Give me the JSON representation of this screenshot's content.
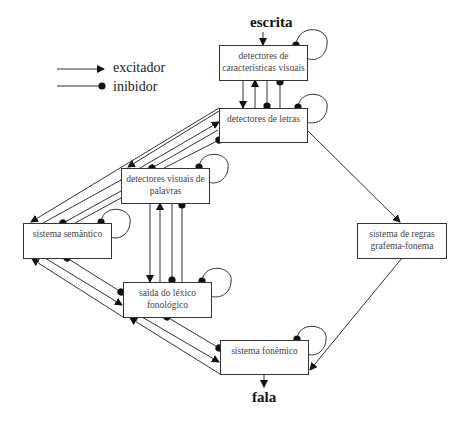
{
  "legend": {
    "excitatory": "excitador",
    "inhibitory": "inibidor"
  },
  "io": {
    "input": "escrita",
    "output": "fala"
  },
  "nodes": [
    {
      "id": "visual-features",
      "label": "detectores de características visuais",
      "line1": "detectores de",
      "line2": "características visuais"
    },
    {
      "id": "letter-detectors",
      "label": "detectores de letras",
      "line1": "detectores de letras",
      "line2": ""
    },
    {
      "id": "visual-word-detectors",
      "label": "detectores visuais de palavras",
      "line1": "detectores visuais de",
      "line2": "palavras"
    },
    {
      "id": "semantic-system",
      "label": "sistema semântico",
      "line1": "sistema semântico",
      "line2": ""
    },
    {
      "id": "phonological-lexicon",
      "label": "saída do léxico fonológico",
      "line1": "saída do léxico",
      "line2": "fonológico"
    },
    {
      "id": "gpc-rules",
      "label": "sistema de regras grafema-fonema",
      "line1": "sistema de regras",
      "line2": "grafema-fonema"
    },
    {
      "id": "phoneme-system",
      "label": "sistema fonêmico",
      "line1": "sistema fonêmico",
      "line2": ""
    }
  ],
  "edges": [
    {
      "from": "escrita",
      "to": "visual-features",
      "type": "excitador"
    },
    {
      "from": "visual-features",
      "to": "letter-detectors",
      "type": "excitador"
    },
    {
      "from": "letter-detectors",
      "to": "visual-features",
      "type": "excitador"
    },
    {
      "from": "visual-features",
      "to": "letter-detectors",
      "type": "inibidor"
    },
    {
      "from": "letter-detectors",
      "to": "visual-features",
      "type": "inibidor"
    },
    {
      "from": "letter-detectors",
      "to": "visual-word-detectors",
      "type": "excitador"
    },
    {
      "from": "visual-word-detectors",
      "to": "letter-detectors",
      "type": "excitador"
    },
    {
      "from": "letter-detectors",
      "to": "visual-word-detectors",
      "type": "inibidor"
    },
    {
      "from": "visual-word-detectors",
      "to": "letter-detectors",
      "type": "inibidor"
    },
    {
      "from": "visual-word-detectors",
      "to": "semantic-system",
      "type": "excitador"
    },
    {
      "from": "semantic-system",
      "to": "visual-word-detectors",
      "type": "excitador"
    },
    {
      "from": "visual-word-detectors",
      "to": "semantic-system",
      "type": "inibidor"
    },
    {
      "from": "semantic-system",
      "to": "visual-word-detectors",
      "type": "inibidor"
    },
    {
      "from": "visual-word-detectors",
      "to": "phonological-lexicon",
      "type": "excitador"
    },
    {
      "from": "phonological-lexicon",
      "to": "visual-word-detectors",
      "type": "excitador"
    },
    {
      "from": "visual-word-detectors",
      "to": "phonological-lexicon",
      "type": "inibidor"
    },
    {
      "from": "phonological-lexicon",
      "to": "visual-word-detectors",
      "type": "inibidor"
    },
    {
      "from": "semantic-system",
      "to": "phonological-lexicon",
      "type": "excitador"
    },
    {
      "from": "phonological-lexicon",
      "to": "semantic-system",
      "type": "excitador"
    },
    {
      "from": "semantic-system",
      "to": "phonological-lexicon",
      "type": "inibidor"
    },
    {
      "from": "phonological-lexicon",
      "to": "semantic-system",
      "type": "inibidor"
    },
    {
      "from": "phonological-lexicon",
      "to": "phoneme-system",
      "type": "excitador"
    },
    {
      "from": "phoneme-system",
      "to": "phonological-lexicon",
      "type": "excitador"
    },
    {
      "from": "phonological-lexicon",
      "to": "phoneme-system",
      "type": "inibidor"
    },
    {
      "from": "phoneme-system",
      "to": "phonological-lexicon",
      "type": "inibidor"
    },
    {
      "from": "letter-detectors",
      "to": "gpc-rules",
      "type": "excitador"
    },
    {
      "from": "gpc-rules",
      "to": "phoneme-system",
      "type": "excitador"
    },
    {
      "from": "phoneme-system",
      "to": "fala",
      "type": "excitador"
    }
  ],
  "self_inhibition": [
    "visual-features",
    "letter-detectors",
    "visual-word-detectors",
    "semantic-system",
    "phonological-lexicon",
    "phoneme-system"
  ]
}
